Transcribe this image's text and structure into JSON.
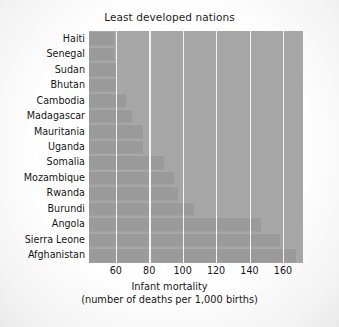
{
  "chart_data": {
    "type": "bar",
    "orientation": "horizontal",
    "title": "Least developed nations",
    "xlabel": "Infant mortality",
    "xlabel_line2": "(number of deaths per 1,000 births)",
    "ylabel": "",
    "categories": [
      "Haiti",
      "Senegal",
      "Sudan",
      "Bhutan",
      "Cambodia",
      "Madagascar",
      "Mauritania",
      "Uganda",
      "Somalia",
      "Mozambique",
      "Rwanda",
      "Burundi",
      "Angola",
      "Sierra Leone",
      "Afghanistan"
    ],
    "values": [
      59,
      59,
      60,
      61,
      66,
      70,
      76,
      76,
      89,
      95,
      97,
      107,
      147,
      158,
      168
    ],
    "xlim": [
      44,
      172
    ],
    "xticks": [
      60,
      80,
      100,
      120,
      140,
      160
    ],
    "xtick_labels": [
      "60",
      "80",
      "100",
      "120",
      "140",
      "160"
    ],
    "grid": true,
    "grid_axis": "x",
    "legend": false,
    "colors": {
      "bar": "#9a9a9a",
      "plot_background": "#a6a6a6",
      "gridline": "#f4f4f4",
      "text": "#161616",
      "page_background": "#fbfbfb"
    }
  }
}
